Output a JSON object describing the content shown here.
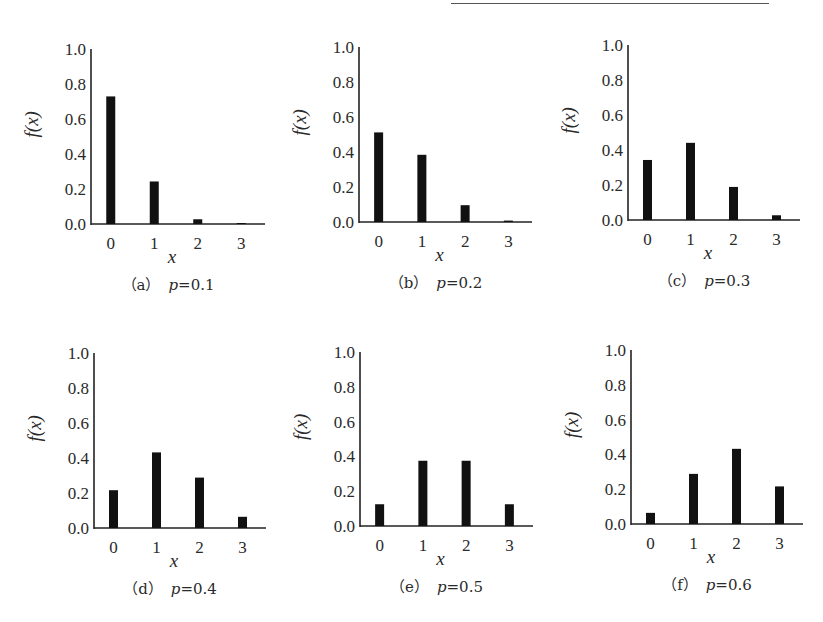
{
  "figure": {
    "ylabel": "f(x)",
    "xlabel": "x",
    "y_ticks": [
      "0.0",
      "0.2",
      "0.4",
      "0.6",
      "0.8",
      "1.0"
    ],
    "x_ticks": [
      "0",
      "1",
      "2",
      "3"
    ],
    "bar_color": "#111111",
    "axis_color": "#222222"
  },
  "panels": [
    {
      "tag": "（a）",
      "param": "p",
      "eq": "=0.1"
    },
    {
      "tag": "（b）",
      "param": "p",
      "eq": "=0.2"
    },
    {
      "tag": "（c）",
      "param": "p",
      "eq": "=0.3"
    },
    {
      "tag": "（d）",
      "param": "p",
      "eq": "=0.4"
    },
    {
      "tag": "（e）",
      "param": "p",
      "eq": "=0.5"
    },
    {
      "tag": "（f）",
      "param": "p",
      "eq": "=0.6"
    }
  ],
  "chart_data": [
    {
      "type": "bar",
      "title": "(a) p=0.1",
      "xlabel": "x",
      "ylabel": "f(x)",
      "categories": [
        0,
        1,
        2,
        3
      ],
      "values": [
        0.729,
        0.243,
        0.027,
        0.001
      ],
      "ylim": [
        0,
        1.0
      ],
      "yticks": [
        0.0,
        0.2,
        0.4,
        0.6,
        0.8,
        1.0
      ],
      "grid": false,
      "legend": null
    },
    {
      "type": "bar",
      "title": "(b) p=0.2",
      "xlabel": "x",
      "ylabel": "f(x)",
      "categories": [
        0,
        1,
        2,
        3
      ],
      "values": [
        0.512,
        0.384,
        0.096,
        0.008
      ],
      "ylim": [
        0,
        1.0
      ],
      "yticks": [
        0.0,
        0.2,
        0.4,
        0.6,
        0.8,
        1.0
      ],
      "grid": false,
      "legend": null
    },
    {
      "type": "bar",
      "title": "(c) p=0.3",
      "xlabel": "x",
      "ylabel": "f(x)",
      "categories": [
        0,
        1,
        2,
        3
      ],
      "values": [
        0.343,
        0.441,
        0.189,
        0.027
      ],
      "ylim": [
        0,
        1.0
      ],
      "yticks": [
        0.0,
        0.2,
        0.4,
        0.6,
        0.8,
        1.0
      ],
      "grid": false,
      "legend": null
    },
    {
      "type": "bar",
      "title": "(d) p=0.4",
      "xlabel": "x",
      "ylabel": "f(x)",
      "categories": [
        0,
        1,
        2,
        3
      ],
      "values": [
        0.216,
        0.432,
        0.288,
        0.064
      ],
      "ylim": [
        0,
        1.0
      ],
      "yticks": [
        0.0,
        0.2,
        0.4,
        0.6,
        0.8,
        1.0
      ],
      "grid": false,
      "legend": null
    },
    {
      "type": "bar",
      "title": "(e) p=0.5",
      "xlabel": "x",
      "ylabel": "f(x)",
      "categories": [
        0,
        1,
        2,
        3
      ],
      "values": [
        0.125,
        0.375,
        0.375,
        0.125
      ],
      "ylim": [
        0,
        1.0
      ],
      "yticks": [
        0.0,
        0.2,
        0.4,
        0.6,
        0.8,
        1.0
      ],
      "grid": false,
      "legend": null
    },
    {
      "type": "bar",
      "title": "(f) p=0.6",
      "xlabel": "x",
      "ylabel": "f(x)",
      "categories": [
        0,
        1,
        2,
        3
      ],
      "values": [
        0.064,
        0.288,
        0.432,
        0.216
      ],
      "ylim": [
        0,
        1.0
      ],
      "yticks": [
        0.0,
        0.2,
        0.4,
        0.6,
        0.8,
        1.0
      ],
      "grid": false,
      "legend": null
    }
  ]
}
